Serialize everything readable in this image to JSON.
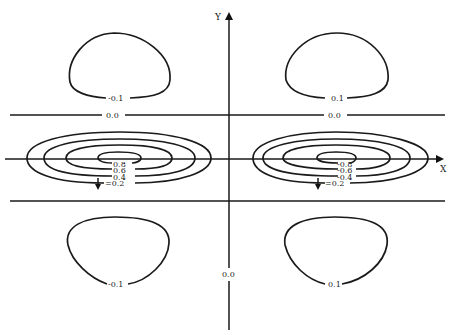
{
  "diagram": {
    "type": "contour_plot",
    "axes": {
      "x_label": "X",
      "y_label": "Y"
    },
    "zero_lines": {
      "upper_label_left": "0.0",
      "upper_label_right": "0.0",
      "y_axis_label": "0.0"
    },
    "top_loops": {
      "left_label": "-0.1",
      "right_label": "0.1"
    },
    "bottom_loops": {
      "left_label": "-0.1",
      "right_label": "0.1"
    },
    "left_spiral": {
      "labels": [
        "0.8",
        "0.6",
        "0.4",
        "=0.2"
      ]
    },
    "right_spiral": {
      "labels": [
        "-0.8",
        "-0.6",
        "-0.4",
        "=0.2"
      ]
    }
  }
}
